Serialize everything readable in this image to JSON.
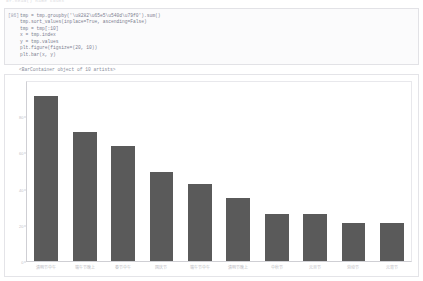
{
  "notebook": {
    "top_ghost_text": "df.head()    name    count",
    "input_prompt": "[86]",
    "code_lines": [
      "tmp = tmp.groupby('\\u8282\\u65e5\\u540d\\u79f0').sum()",
      "tmp.sort_values(inplace=True, ascending=False)",
      "tmp = tmp[:10]",
      "x = tmp.index",
      "y = tmp.values",
      "plt.figure(figsize=(20, 10))",
      "plt.bar(x, y)"
    ],
    "output_text": "<BarContainer object of 10 artists>"
  },
  "chart_data": {
    "type": "bar",
    "title": "",
    "xlabel": "",
    "ylabel": "",
    "grid": false,
    "legend": false,
    "bar_color": "#5a5a5a",
    "ylim": [
      0,
      100
    ],
    "yticks": [
      0,
      20,
      40,
      60,
      80
    ],
    "ytick_labels": [
      "0",
      "20",
      "40",
      "60",
      "80"
    ],
    "categories": [
      "清明节中午",
      "端午节晚上",
      "春节中午",
      "国庆节",
      "端午节中午",
      "清明节晚上",
      "中秋节",
      "元旦节",
      "劳动节",
      "元宵节"
    ],
    "values": [
      92,
      72,
      64,
      50,
      43,
      35,
      26,
      26,
      21,
      21
    ]
  }
}
